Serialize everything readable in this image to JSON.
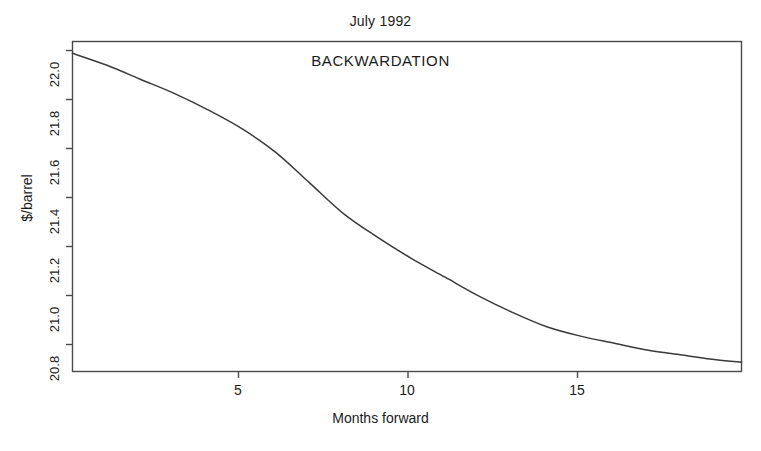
{
  "chart_data": {
    "type": "line",
    "title": "July 1992",
    "xlabel": "Months forward",
    "ylabel": "$/barrel",
    "annotations": [
      {
        "text": "BACKWARDATION",
        "x": 10.0,
        "y": 22.0
      }
    ],
    "grid": false,
    "legend": null,
    "xlim": [
      0.0,
      19.75
    ],
    "ylim": [
      20.72,
      22.12
    ],
    "xticks": [
      5,
      10,
      15
    ],
    "xtick_labels": [
      "5",
      "10",
      "15"
    ],
    "yticks": [
      20.8,
      21.0,
      21.2,
      21.4,
      21.6,
      21.8,
      22.0
    ],
    "ytick_labels": [
      "20.8",
      "21.0",
      "21.2",
      "21.4",
      "21.6",
      "21.8",
      "22.0"
    ],
    "series": [
      {
        "name": "Forward price curve",
        "color": "#3a3a3a",
        "x": [
          0.0,
          1.0,
          2.0,
          3.0,
          4.0,
          5.0,
          6.0,
          7.0,
          8.0,
          9.0,
          10.0,
          11.0,
          12.0,
          13.0,
          14.0,
          15.0,
          16.0,
          17.0,
          18.0,
          19.0,
          19.75
        ],
        "values": [
          22.07,
          22.02,
          21.96,
          21.9,
          21.83,
          21.75,
          21.65,
          21.52,
          21.39,
          21.29,
          21.2,
          21.12,
          21.04,
          20.97,
          20.91,
          20.87,
          20.84,
          20.81,
          20.79,
          20.77,
          20.76
        ]
      }
    ]
  },
  "figure": {
    "background_color": "#ffffff",
    "axis_color": "#4a4a4a",
    "line_color": "#3a3a3a"
  }
}
